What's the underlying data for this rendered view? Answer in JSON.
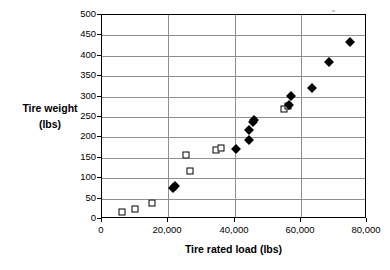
{
  "chart_data": {
    "type": "scatter",
    "title": "",
    "xlabel": "Tire rated load (lbs)",
    "ylabel_line1": "Tire weight",
    "ylabel_line2": "(lbs)",
    "xlim": [
      0,
      80000
    ],
    "ylim": [
      0,
      500
    ],
    "xticks": [
      0,
      20000,
      40000,
      60000,
      80000
    ],
    "xtick_labels": [
      "0",
      "20,000",
      "40,000",
      "60,000",
      "80,000"
    ],
    "yticks": [
      0,
      50,
      100,
      150,
      200,
      250,
      300,
      350,
      400,
      450,
      500
    ],
    "ytick_labels": [
      "0",
      "50",
      "100",
      "150",
      "200",
      "250",
      "300",
      "350",
      "400",
      "450",
      "500"
    ],
    "grid": "horizontal-and-vertical",
    "legend": "none",
    "series": [
      {
        "name": "open-square-series",
        "marker": "open-square",
        "color": "#000000",
        "points": [
          {
            "x": 6000,
            "y": 17
          },
          {
            "x": 10000,
            "y": 24
          },
          {
            "x": 15000,
            "y": 40
          },
          {
            "x": 25500,
            "y": 156
          },
          {
            "x": 26500,
            "y": 118
          },
          {
            "x": 34500,
            "y": 170
          },
          {
            "x": 36000,
            "y": 175
          },
          {
            "x": 55000,
            "y": 270
          },
          {
            "x": 56000,
            "y": 278
          }
        ]
      },
      {
        "name": "filled-diamond-series",
        "marker": "filled-diamond",
        "color": "#000000",
        "points": [
          {
            "x": 21500,
            "y": 75
          },
          {
            "x": 22000,
            "y": 82
          },
          {
            "x": 40500,
            "y": 171
          },
          {
            "x": 44500,
            "y": 194
          },
          {
            "x": 44500,
            "y": 218
          },
          {
            "x": 45500,
            "y": 238
          },
          {
            "x": 46000,
            "y": 243
          },
          {
            "x": 56500,
            "y": 280
          },
          {
            "x": 57000,
            "y": 302
          },
          {
            "x": 63500,
            "y": 320
          },
          {
            "x": 68500,
            "y": 385
          },
          {
            "x": 75000,
            "y": 433
          }
        ]
      }
    ]
  }
}
